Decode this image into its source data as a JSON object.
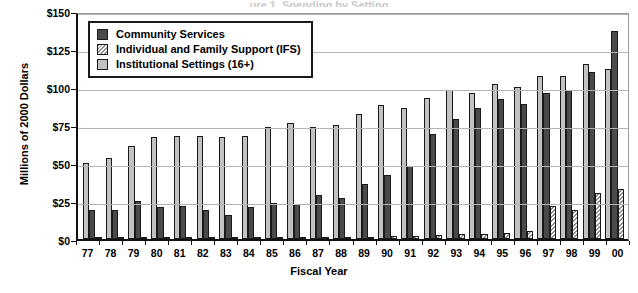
{
  "title_sliver": "ure 1. Spending by Setting",
  "axes": {
    "ylabel": "Millions of 2000 Dollars",
    "xlabel": "Fiscal Year",
    "yticks": [
      "$0",
      "$25",
      "$50",
      "$75",
      "$100",
      "$125",
      "$150"
    ]
  },
  "legend": {
    "items": [
      {
        "label": "Community Services",
        "swatch": "dark-gray-square-icon",
        "color": "#4a4a4a"
      },
      {
        "label": "Individual and Family Support (IFS)",
        "swatch": "hatched-square-icon",
        "color": "#8d8d8d"
      },
      {
        "label": "Institutional Settings (16+)",
        "swatch": "light-gray-square-icon",
        "color": "#c2c2c2"
      }
    ]
  },
  "chart_data": {
    "type": "bar",
    "title": "Spending by Setting",
    "xlabel": "Fiscal Year",
    "ylabel": "Millions of 2000 Dollars",
    "ylim": [
      0,
      150
    ],
    "ytick_step": 25,
    "grid": true,
    "legend_position": "top-left-inside",
    "bar_order": [
      "Institutional Settings (16+)",
      "Community Services",
      "Individual and Family Support (IFS)"
    ],
    "categories": [
      "77",
      "78",
      "79",
      "80",
      "81",
      "82",
      "83",
      "84",
      "85",
      "86",
      "87",
      "88",
      "89",
      "90",
      "91",
      "92",
      "93",
      "94",
      "95",
      "96",
      "97",
      "98",
      "99",
      "00"
    ],
    "series": [
      {
        "name": "Institutional Settings (16+)",
        "color": "#c2c2c2",
        "values": [
          50,
          53,
          61,
          67,
          68,
          68,
          67,
          68,
          74,
          76,
          74,
          75,
          82,
          88,
          86,
          93,
          98,
          96,
          102,
          100,
          107,
          107,
          115,
          112
        ]
      },
      {
        "name": "Community Services",
        "color": "#4a4a4a",
        "values": [
          19,
          19,
          25,
          21,
          22,
          19,
          16,
          21,
          24,
          23,
          29,
          27,
          36,
          42,
          48,
          69,
          79,
          86,
          92,
          89,
          96,
          98,
          110,
          137
        ]
      },
      {
        "name": "Individual and Family Support (IFS)",
        "color": "#8d8d8d",
        "values": [
          0.5,
          0.5,
          0.7,
          0.7,
          0.8,
          0.8,
          0.8,
          0.9,
          1,
          1,
          1.2,
          1.3,
          1.5,
          1.8,
          2,
          2.5,
          3,
          3.5,
          4,
          5,
          22,
          19,
          30,
          33
        ]
      }
    ]
  }
}
